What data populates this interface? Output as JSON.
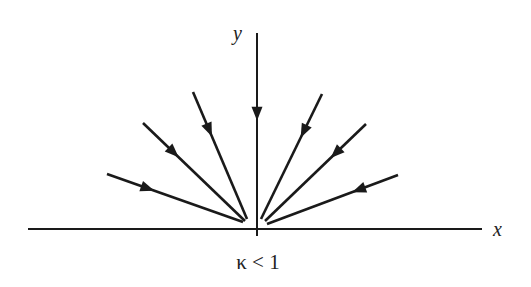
{
  "diagram": {
    "axis_x_label": "x",
    "axis_y_label": "y",
    "caption": "κ < 1",
    "stroke_color": "#1a1a1a",
    "origin": [
      257,
      229
    ],
    "x_axis": {
      "from": [
        28,
        229
      ],
      "to": [
        482,
        229
      ]
    },
    "y_axis": {
      "from": [
        257,
        33
      ],
      "to": [
        257,
        236
      ]
    },
    "rays": [
      {
        "name": "ray-left-1",
        "from": [
          107,
          174
        ],
        "to": [
          243,
          222
        ]
      },
      {
        "name": "ray-left-2",
        "from": [
          143,
          123
        ],
        "to": [
          245,
          221
        ]
      },
      {
        "name": "ray-left-3",
        "from": [
          193,
          92
        ],
        "to": [
          247,
          219
        ]
      },
      {
        "name": "ray-vertical",
        "from": [
          257,
          33
        ],
        "to": [
          257,
          225
        ]
      },
      {
        "name": "ray-right-1",
        "from": [
          322,
          94
        ],
        "to": [
          261,
          219
        ]
      },
      {
        "name": "ray-right-2",
        "from": [
          366,
          124
        ],
        "to": [
          265,
          221
        ]
      },
      {
        "name": "ray-right-3",
        "from": [
          398,
          175
        ],
        "to": [
          267,
          224
        ]
      }
    ],
    "arrow_direction": "toward-origin"
  }
}
